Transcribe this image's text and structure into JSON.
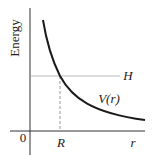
{
  "diagram": {
    "type": "potential-energy-graph",
    "y_axis_label": "Energy",
    "x_axis_label": "r",
    "origin_label": "0",
    "level_label": "H",
    "curve_label": "V(r)",
    "intersection_label": "R",
    "colors": {
      "curve": "#1a1a1a",
      "axes": "#333333",
      "level_line": "#bbbbbb",
      "dashed_line": "#999999",
      "text": "#222222"
    }
  }
}
